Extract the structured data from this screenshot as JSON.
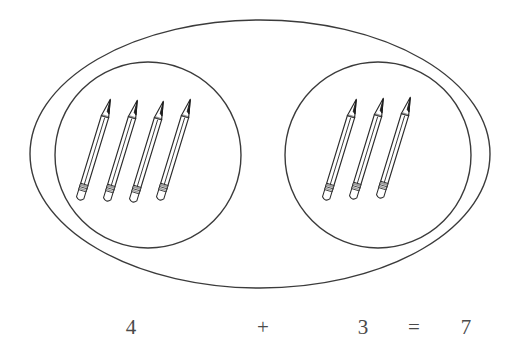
{
  "page": {
    "background_color": "#ffffff",
    "width": 514,
    "height": 360
  },
  "diagram": {
    "type": "venn-style-grouping",
    "object_name": "pencil",
    "stroke_color": "#3b3b3b",
    "outer_set": {
      "name": "outer-oval",
      "total_count": 7,
      "cx": 260,
      "cy": 154,
      "rx": 230,
      "ry": 134
    },
    "groups": [
      {
        "name": "left-group",
        "count": 4,
        "cx": 148,
        "cy": 155,
        "r": 93
      },
      {
        "name": "right-group",
        "count": 3,
        "cx": 378,
        "cy": 155,
        "r": 93
      }
    ]
  },
  "equation": {
    "text": "4 + 3 = 7",
    "color": "#4a4a4a",
    "baseline_y": 334,
    "terms": [
      {
        "label": "4",
        "role": "addend",
        "x": 131
      },
      {
        "label": "+",
        "role": "operator",
        "x": 263
      },
      {
        "label": "3",
        "role": "addend",
        "x": 363
      },
      {
        "label": "=",
        "role": "operator",
        "x": 414
      },
      {
        "label": "7",
        "role": "sum",
        "x": 466
      }
    ]
  },
  "pencils": {
    "left": [
      {
        "id": "left-pencil-1",
        "tip_x": 128,
        "tip_y": 99,
        "end_x": 95,
        "end_y": 203
      },
      {
        "id": "left-pencil-2",
        "tip_x": 155,
        "tip_y": 100,
        "end_x": 122,
        "end_y": 204
      },
      {
        "id": "left-pencil-3",
        "tip_x": 181,
        "tip_y": 101,
        "end_x": 148,
        "end_y": 205
      },
      {
        "id": "left-pencil-4",
        "tip_x": 208,
        "tip_y": 99,
        "end_x": 175,
        "end_y": 203
      }
    ],
    "right": [
      {
        "id": "right-pencil-1",
        "tip_x": 374,
        "tip_y": 99,
        "end_x": 341,
        "end_y": 203
      },
      {
        "id": "right-pencil-2",
        "tip_x": 401,
        "tip_y": 98,
        "end_x": 368,
        "end_y": 202
      },
      {
        "id": "right-pencil-3",
        "tip_x": 428,
        "tip_y": 97,
        "end_x": 395,
        "end_y": 201
      }
    ]
  }
}
